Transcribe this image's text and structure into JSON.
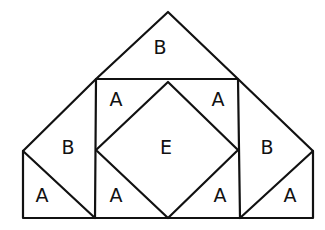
{
  "diagram": {
    "type": "quilt-block-layout",
    "stroke_color": "#111111",
    "background": "#ffffff",
    "regions": [
      {
        "id": "top-triangle",
        "label": "B",
        "x": 160,
        "y": 48
      },
      {
        "id": "square-top-left",
        "label": "A",
        "x": 116,
        "y": 100
      },
      {
        "id": "square-top-right",
        "label": "A",
        "x": 218,
        "y": 100
      },
      {
        "id": "center-diamond",
        "label": "E",
        "x": 166,
        "y": 148
      },
      {
        "id": "left-upper-triangle",
        "label": "B",
        "x": 68,
        "y": 148
      },
      {
        "id": "right-upper-triangle",
        "label": "B",
        "x": 267,
        "y": 148
      },
      {
        "id": "left-lower-triangle",
        "label": "A",
        "x": 42,
        "y": 196
      },
      {
        "id": "square-bottom-left",
        "label": "A",
        "x": 116,
        "y": 196
      },
      {
        "id": "square-bottom-right",
        "label": "A",
        "x": 220,
        "y": 196
      },
      {
        "id": "right-lower-triangle",
        "label": "A",
        "x": 290,
        "y": 196
      }
    ]
  }
}
